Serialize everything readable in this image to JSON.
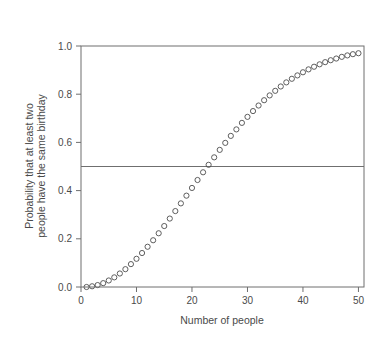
{
  "chart_data": {
    "type": "scatter",
    "title": "",
    "subtitle": "",
    "xlabel": "Number of people",
    "ylabel_line1": "Probability that at least two",
    "ylabel_line2": "people have the same birthday",
    "ylabel": "Probability that at least two people have the same birthday",
    "xlim": [
      0,
      51
    ],
    "ylim": [
      0.0,
      1.0
    ],
    "xticks": [
      0,
      10,
      20,
      30,
      40,
      50
    ],
    "xtick_labels": [
      "0",
      "10",
      "20",
      "30",
      "40",
      "50"
    ],
    "yticks": [
      0.0,
      0.2,
      0.4,
      0.6,
      0.8,
      1.0
    ],
    "ytick_labels": [
      "0.0",
      "0.2",
      "0.4",
      "0.6",
      "0.8",
      "1.0"
    ],
    "grid": false,
    "legend": null,
    "marker": "open-circle",
    "marker_radius": 2.6,
    "marker_color": "#4d4d4d",
    "axis_color": "#6f6f6f",
    "background": "#ffffff",
    "annotations": [
      {
        "name": "half-probability-reference-line",
        "type": "hline",
        "y": 0.5,
        "color": "#6f6f6f"
      }
    ],
    "x": [
      1,
      2,
      3,
      4,
      5,
      6,
      7,
      8,
      9,
      10,
      11,
      12,
      13,
      14,
      15,
      16,
      17,
      18,
      19,
      20,
      21,
      22,
      23,
      24,
      25,
      26,
      27,
      28,
      29,
      30,
      31,
      32,
      33,
      34,
      35,
      36,
      37,
      38,
      39,
      40,
      41,
      42,
      43,
      44,
      45,
      46,
      47,
      48,
      49,
      50
    ],
    "values": [
      0.0,
      0.003,
      0.008,
      0.016,
      0.027,
      0.04,
      0.056,
      0.074,
      0.095,
      0.117,
      0.141,
      0.167,
      0.194,
      0.223,
      0.253,
      0.284,
      0.315,
      0.347,
      0.379,
      0.411,
      0.444,
      0.476,
      0.507,
      0.538,
      0.569,
      0.598,
      0.627,
      0.654,
      0.681,
      0.706,
      0.73,
      0.753,
      0.775,
      0.795,
      0.814,
      0.832,
      0.849,
      0.864,
      0.878,
      0.891,
      0.903,
      0.914,
      0.924,
      0.933,
      0.941,
      0.948,
      0.955,
      0.961,
      0.966,
      0.97
    ]
  }
}
